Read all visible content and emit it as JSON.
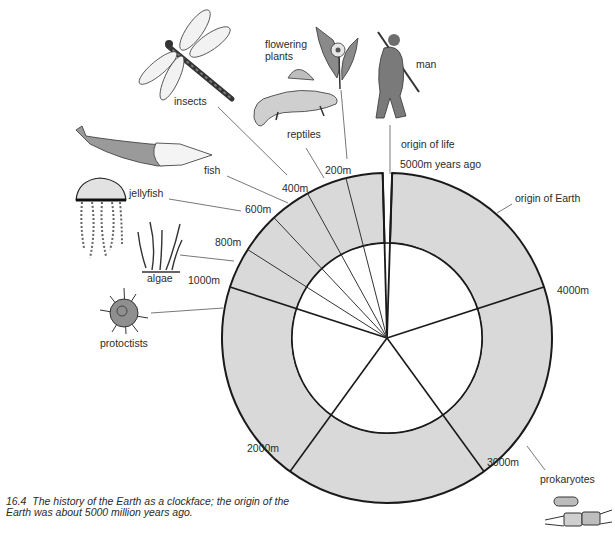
{
  "figure": {
    "caption_number": "16.4",
    "caption_text": "The history of the Earth as a clockface; the origin of the Earth was about 5000 million years ago."
  },
  "clock": {
    "center": [
      387,
      338
    ],
    "outer_radius": 165,
    "inner_radius": 95,
    "ring_fill": "#d9d9d9",
    "inner_fill": "#ffffff",
    "stroke": "#1a1a1a",
    "total_years_m": 5000,
    "major_ticks": [
      {
        "value_m": 5000,
        "label": "5000m years ago",
        "label_pos": [
          400,
          168
        ]
      },
      {
        "value_m": 4000,
        "label": "4000m",
        "label_pos": [
          557,
          294
        ]
      },
      {
        "value_m": 3000,
        "label": "3000m",
        "label_pos": [
          487,
          466
        ]
      },
      {
        "value_m": 2000,
        "label": "2000m",
        "label_pos": [
          247,
          452
        ]
      },
      {
        "value_m": 1000,
        "label": "1000m",
        "label_pos": [
          188,
          284
        ]
      }
    ],
    "minor_ticks": [
      {
        "value_m": 800,
        "label": "800m",
        "label_pos": [
          215,
          246
        ]
      },
      {
        "value_m": 600,
        "label": "600m",
        "label_pos": [
          245,
          213
        ]
      },
      {
        "value_m": 400,
        "label": "400m",
        "label_pos": [
          282,
          192
        ]
      },
      {
        "value_m": 200,
        "label": "200m",
        "label_pos": [
          325,
          174
        ]
      }
    ],
    "gap_deg": [
      -1.5,
      1.8
    ]
  },
  "events": [
    {
      "name": "origin of Earth",
      "label": "origin of Earth",
      "label_pos": [
        515,
        202
      ],
      "leader": [
        [
          512,
          204
        ],
        [
          497,
          213
        ]
      ]
    },
    {
      "name": "origin of life",
      "label": "origin of life",
      "label_pos": [
        401,
        148
      ],
      "leader": null
    },
    {
      "name": "man",
      "label": "man",
      "label_pos": [
        416,
        68
      ],
      "leader": [
        [
          390,
          125
        ],
        [
          390,
          174
        ]
      ]
    },
    {
      "name": "flowering plants",
      "label_lines": [
        "flowering",
        "plants"
      ],
      "label_pos": [
        265,
        48
      ],
      "leader": [
        [
          341,
          90
        ],
        [
          347,
          159
        ]
      ]
    },
    {
      "name": "reptiles",
      "label": "reptiles",
      "label_pos": [
        287,
        138
      ],
      "leader": [
        [
          306,
          148
        ],
        [
          324,
          178
        ]
      ]
    },
    {
      "name": "insects",
      "label": "insects",
      "label_pos": [
        174,
        105
      ],
      "leader": [
        [
          218,
          107
        ],
        [
          287,
          175
        ]
      ]
    },
    {
      "name": "fish",
      "label": "fish",
      "label_pos": [
        204,
        174
      ],
      "leader": [
        [
          227,
          176
        ],
        [
          288,
          203
        ]
      ]
    },
    {
      "name": "jellyfish",
      "label": "jellyfish",
      "label_pos": [
        129,
        197
      ],
      "leader": [
        [
          169,
          199
        ],
        [
          241,
          211
        ]
      ]
    },
    {
      "name": "algae",
      "label": "algae",
      "label_pos": [
        147,
        282
      ],
      "leader": [
        [
          180,
          255
        ],
        [
          234,
          261
        ]
      ]
    },
    {
      "name": "protoctists",
      "label": "protoctists",
      "label_pos": [
        100,
        347
      ],
      "leader": [
        [
          151,
          313
        ],
        [
          223,
          308
        ]
      ]
    },
    {
      "name": "prokaryotes",
      "label": "prokaryotes",
      "label_pos": [
        540,
        483
      ],
      "leader": [
        [
          527,
          446
        ],
        [
          545,
          470
        ]
      ]
    }
  ]
}
